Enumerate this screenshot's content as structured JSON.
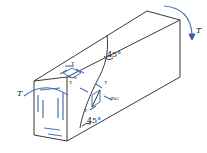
{
  "diagram": {
    "labels": {
      "torque_left": "T",
      "torque_right": "T",
      "tau_top_upper": "τ",
      "tau_top_lower": "τ",
      "tau_side_right": "τ",
      "tau_side_left": "τ",
      "sigma": "σ₄₅",
      "angle_top": "45°",
      "angle_bottom": "45°"
    },
    "colors": {
      "edges": "#222222",
      "stress_arrows": "#3a5fa8",
      "background": "#ffffff"
    }
  }
}
